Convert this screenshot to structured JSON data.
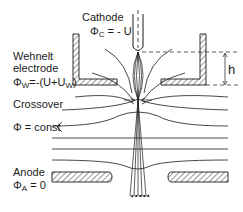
{
  "diagram": {
    "type": "electron-gun schematic",
    "labels": {
      "cathode": "Cathode",
      "cathode_potential_symbol": "Φ",
      "cathode_potential_sub": "C",
      "cathode_potential_value": " = - U",
      "wehnelt_line1": "Wehnelt",
      "wehnelt_line2": "electrode",
      "wehnelt_potential_symbol": "Φ",
      "wehnelt_potential_sub": "W",
      "wehnelt_potential_value": "=-(U+U",
      "wehnelt_potential_sub2": "W",
      "wehnelt_potential_close": ")",
      "crossover": "Crossover",
      "equipotential": "Φ = const",
      "anode": "Anode",
      "anode_potential_symbol": "Φ",
      "anode_potential_sub": "A",
      "anode_potential_value": " = 0",
      "height": "h"
    },
    "colors": {
      "line": "#1a1a1a",
      "background": "#ffffff"
    }
  }
}
